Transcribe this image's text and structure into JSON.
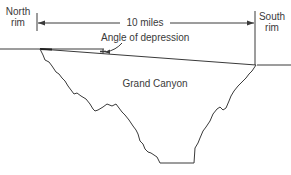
{
  "diagram": {
    "labels": {
      "north_rim_line1": "North",
      "north_rim_line2": "rim",
      "south_rim_line1": "South",
      "south_rim_line2": "rim",
      "distance": "10 miles",
      "angle": "Angle of depression",
      "canyon": "Grand Canyon"
    },
    "colors": {
      "stroke": "#3a3a3a",
      "text": "#3a3a3a",
      "background": "#ffffff"
    }
  }
}
